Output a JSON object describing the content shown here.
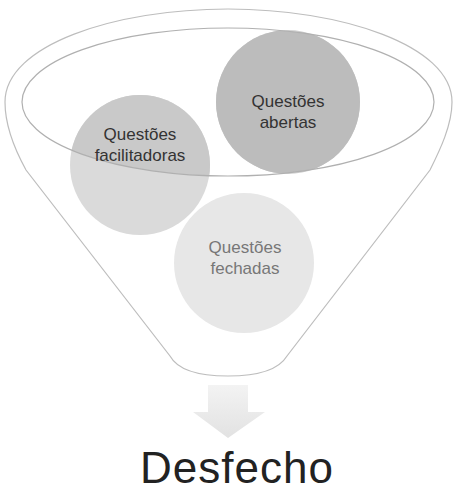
{
  "diagram": {
    "type": "funnel",
    "items": [
      {
        "id": "facilitadoras",
        "label_line1": "Questões",
        "label_line2": "facilitadoras",
        "text_color": "#333333"
      },
      {
        "id": "abertas",
        "label_line1": "Questões",
        "label_line2": "abertas",
        "text_color": "#333333"
      },
      {
        "id": "fechadas",
        "label_line1": "Questões",
        "label_line2": "fechadas",
        "text_color": "#777777"
      }
    ],
    "outcome": "Desfecho",
    "colors": {
      "outline": "#b5b5b5",
      "circle_abertas": "#c4c4c4",
      "circle_facilitadoras": "#d9d9d9",
      "circle_fechadas": "#e6e6e6",
      "arrow": "#e8e8e8"
    }
  }
}
